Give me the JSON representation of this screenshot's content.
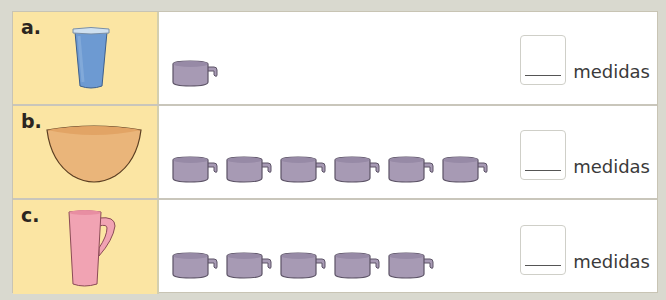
{
  "rows": [
    {
      "letter": "a.",
      "vessel": "blue-glass",
      "cup_count": 1,
      "unit": "medidas"
    },
    {
      "letter": "b.",
      "vessel": "orange-bowl",
      "cup_count": 6,
      "unit": "medidas"
    },
    {
      "letter": "c.",
      "vessel": "pink-mug",
      "cup_count": 5,
      "unit": "medidas"
    }
  ],
  "colors": {
    "label_bg": "#fbe5a3",
    "page_bg": "#d9d9cf",
    "cup": "#a79ab4",
    "glass": "#6d9ad2",
    "bowl": "#eab57a",
    "mug": "#f1a3b3"
  }
}
